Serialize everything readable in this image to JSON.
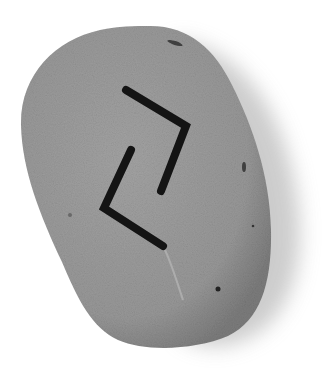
{
  "scene": {
    "subject": "rune stone",
    "alt": "Grey pebble with a black painted rune resembling Eihwaz",
    "background_color": "#ffffff",
    "stone_color": "#9a9a9a",
    "stone_edge_color": "#7e7e7e",
    "shadow_color": "#c8c8c8",
    "rune_color": "#141414",
    "rune_name": "Eihwaz"
  }
}
